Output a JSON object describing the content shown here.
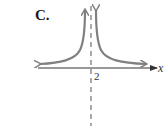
{
  "figure": {
    "option_label": "C.",
    "axis": {
      "x_label": "x"
    },
    "tick_labels": [
      "2"
    ],
    "asymptote": {
      "type": "vertical",
      "x": 2,
      "style": "dashed"
    },
    "curve": {
      "description": "graph with vertical asymptote at x = 2, both branches rising to +infinity near the asymptote and approaching a horizontal asymptote just above the x-axis",
      "color": "#808080"
    },
    "colors": {
      "axis": "#333333",
      "curve": "#808080",
      "asymptote": "#555555"
    }
  }
}
